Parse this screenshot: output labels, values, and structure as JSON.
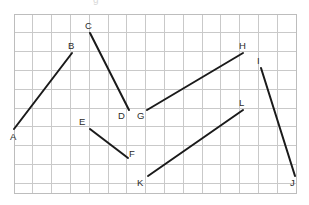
{
  "figure": {
    "background_color": "#ffffff"
  },
  "grid": {
    "x_start": 14,
    "y_start": 14,
    "cell_size": 18.8,
    "columns": 15,
    "rows": 9.5,
    "x_end": 296,
    "y_end": 193,
    "line_color": "#c9c9c9",
    "border_color": "#bdbdbd",
    "line_width": 1
  },
  "style": {
    "segment_color": "#1a1a1a",
    "segment_width": 2,
    "label_color": "#2b2b2b",
    "label_font_size": 9.5
  },
  "points": [
    {
      "name": "A",
      "x": 14,
      "y": 129,
      "label_x": 10,
      "label_y": 140
    },
    {
      "name": "B",
      "x": 72,
      "y": 53,
      "label_x": 68,
      "label_y": 49
    },
    {
      "name": "C",
      "x": 90,
      "y": 33,
      "label_x": 85,
      "label_y": 29
    },
    {
      "name": "D",
      "x": 129,
      "y": 110,
      "label_x": 118,
      "label_y": 119
    },
    {
      "name": "E",
      "x": 90,
      "y": 129,
      "label_x": 79,
      "label_y": 125
    },
    {
      "name": "F",
      "x": 128,
      "y": 158,
      "label_x": 129,
      "label_y": 157
    },
    {
      "name": "G",
      "x": 147,
      "y": 110,
      "label_x": 137,
      "label_y": 119
    },
    {
      "name": "H",
      "x": 243,
      "y": 53,
      "label_x": 239,
      "label_y": 49
    },
    {
      "name": "I",
      "x": 261,
      "y": 68,
      "label_x": 257,
      "label_y": 64
    },
    {
      "name": "J",
      "x": 295,
      "y": 176,
      "label_x": 290,
      "label_y": 186
    },
    {
      "name": "K",
      "x": 148,
      "y": 176,
      "label_x": 137,
      "label_y": 186
    },
    {
      "name": "L",
      "x": 243,
      "y": 110,
      "label_x": 239,
      "label_y": 106
    }
  ],
  "segments": [
    {
      "name": "AB",
      "from": "A",
      "to": "B",
      "x1": 14,
      "y1": 129,
      "x2": 72,
      "y2": 53
    },
    {
      "name": "CD",
      "from": "C",
      "to": "D",
      "x1": 90,
      "y1": 33,
      "x2": 129,
      "y2": 110
    },
    {
      "name": "EF",
      "from": "E",
      "to": "F",
      "x1": 90,
      "y1": 129,
      "x2": 128,
      "y2": 158
    },
    {
      "name": "GH",
      "from": "G",
      "to": "H",
      "x1": 147,
      "y1": 110,
      "x2": 243,
      "y2": 53
    },
    {
      "name": "IJ",
      "from": "I",
      "to": "J",
      "x1": 261,
      "y1": 68,
      "x2": 295,
      "y2": 176
    },
    {
      "name": "KL",
      "from": "K",
      "to": "L",
      "x1": 148,
      "y1": 176,
      "x2": 243,
      "y2": 110
    }
  ],
  "artifact": {
    "top_text": "g"
  }
}
